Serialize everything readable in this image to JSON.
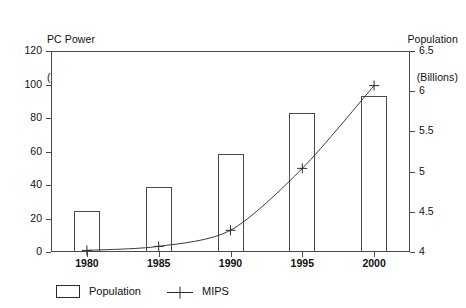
{
  "chart_data": {
    "type": "bar",
    "title": "",
    "subtitle": "",
    "xlabel": "",
    "ylabel": "PC Power (MIPS)",
    "y2label": "Population (Billions)",
    "categories": [
      "1980",
      "1985",
      "1990",
      "1995",
      "2000"
    ],
    "x": [
      1980,
      1985,
      1990,
      1995,
      2000
    ],
    "grid": false,
    "legend_position": "bottom-left",
    "ylim": [
      0,
      120
    ],
    "y2lim": [
      4,
      6.5
    ],
    "yticks": [
      "0",
      "20",
      "40",
      "60",
      "80",
      "100",
      "120"
    ],
    "ytick_values": [
      0,
      20,
      40,
      60,
      80,
      100,
      120
    ],
    "y2ticks": [
      "4",
      "4.5",
      "5",
      "5.5",
      "6",
      "6.5"
    ],
    "y2tick_values": [
      4,
      4.5,
      5,
      5.5,
      6,
      6.5
    ],
    "series": [
      {
        "name": "Population",
        "type": "bar",
        "axis": "left",
        "values": [
          24.5,
          39,
          58.5,
          83,
          93
        ]
      },
      {
        "name": "MIPS",
        "type": "line",
        "axis": "right",
        "marker": "plus",
        "values": [
          4.02,
          4.07,
          4.27,
          5.04,
          6.07
        ]
      }
    ]
  },
  "axes": {
    "left_title_line1": "PC Power",
    "left_title_line2": "(MIPS)",
    "right_title_line1": "Population",
    "right_title_line2": "(Billions)"
  },
  "legend": {
    "items": [
      {
        "label": "Population",
        "marker": "bar-swatch-icon"
      },
      {
        "label": "MIPS",
        "marker": "plus-line-icon"
      }
    ]
  },
  "colors": {
    "axis": "#4a4a4a",
    "text": "#111111",
    "bar_fill": "#ffffff",
    "bar_stroke": "#4a4a4a",
    "line": "#3a3a3a",
    "background": "#ffffff"
  }
}
